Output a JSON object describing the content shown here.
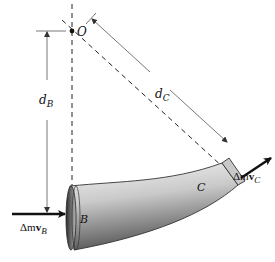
{
  "diagram": {
    "type": "physics-free-body",
    "labels": {
      "point_O": "O",
      "section_B": "B",
      "section_C": "C",
      "dist_B_main": "d",
      "dist_B_sub": "B",
      "dist_C_main": "d",
      "dist_C_sub": "C",
      "momentum_B_prefix": "Δm",
      "momentum_B_vec": "v",
      "momentum_B_sub": "B",
      "momentum_C_prefix": "Δm",
      "momentum_C_vec": "v",
      "momentum_C_sub": "C"
    },
    "colors": {
      "line": "#111111",
      "dim_line": "#555555",
      "pipe_dark": "#4a4a4a",
      "pipe_light": "#f2f2f2"
    }
  }
}
